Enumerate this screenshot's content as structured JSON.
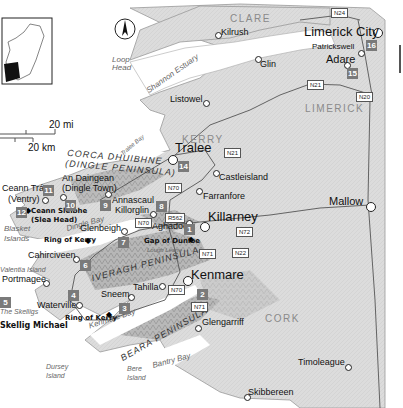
{
  "map": {
    "title": "Southwest Ireland — Kerry & Cork",
    "colors": {
      "land": "#d9d9d9",
      "land_dark": "#9a9a9a",
      "water": "#ffffff",
      "road": "#ffffff",
      "number_box": "#7a7a7a"
    },
    "north_arrow": "N",
    "scale": {
      "miles": "20 mi",
      "km": "20 km"
    },
    "counties": [
      {
        "name": "CLARE"
      },
      {
        "name": "KERRY"
      },
      {
        "name": "LIMERICK"
      },
      {
        "name": "CORK"
      }
    ],
    "peninsulas": [
      {
        "name": "CORCA DHUIBHNE"
      },
      {
        "name": "(DINGLE PENINSULA)"
      },
      {
        "name": "IVERAGH PENINSULA"
      },
      {
        "name": "BEARA PENINSULA"
      }
    ],
    "water": [
      {
        "name": "Shannon Estuary"
      },
      {
        "name": "Loop Head"
      },
      {
        "name": "Tralee Bay"
      },
      {
        "name": "Dingle Bay"
      },
      {
        "name": "Kenmare Bay"
      },
      {
        "name": "Bantry Bay"
      },
      {
        "name": "Lough Leane"
      },
      {
        "name": "Blasket Islands"
      },
      {
        "name": "Valentia Island"
      },
      {
        "name": "The Skelligs"
      },
      {
        "name": "Dursey Island"
      },
      {
        "name": "Bere Island"
      }
    ],
    "towns": [
      {
        "name": "Limerick City"
      },
      {
        "name": "Patrickswell"
      },
      {
        "name": "Adare"
      },
      {
        "name": "Kilrush"
      },
      {
        "name": "Glin"
      },
      {
        "name": "Listowel"
      },
      {
        "name": "Tralee"
      },
      {
        "name": "Castleisland"
      },
      {
        "name": "Farranfore"
      },
      {
        "name": "Killarney"
      },
      {
        "name": "Mallow"
      },
      {
        "name": "Ceann Trá"
      },
      {
        "name": "(Ventry)"
      },
      {
        "name": "An Daingean"
      },
      {
        "name": "(Dingle Town)"
      },
      {
        "name": "Annascaul"
      },
      {
        "name": "Killorglin"
      },
      {
        "name": "Glenbeigh"
      },
      {
        "name": "Aghadoe"
      },
      {
        "name": "Cahirciveen"
      },
      {
        "name": "Portmagee"
      },
      {
        "name": "Waterville"
      },
      {
        "name": "Sneem"
      },
      {
        "name": "Tahilla"
      },
      {
        "name": "Kenmare"
      },
      {
        "name": "Glengarriff"
      },
      {
        "name": "Timoleague"
      },
      {
        "name": "Skibbereen"
      }
    ],
    "points_of_interest": [
      {
        "name": "Ceann Sléibhe"
      },
      {
        "name": "(Slea Head)"
      },
      {
        "name": "Ring of Kerry"
      },
      {
        "name": "Gap of Dunloe"
      },
      {
        "name": "Ring of Kerry"
      },
      {
        "name": "Skellig Michael"
      }
    ],
    "roads": [
      "N24",
      "N21",
      "N20",
      "N21",
      "N70",
      "R562",
      "N70",
      "N72",
      "N71",
      "N22",
      "N70",
      "N71"
    ],
    "stops": [
      "1",
      "2",
      "3",
      "4",
      "5",
      "6",
      "7",
      "8",
      "9",
      "10",
      "11",
      "12",
      "14",
      "15",
      "16"
    ]
  }
}
